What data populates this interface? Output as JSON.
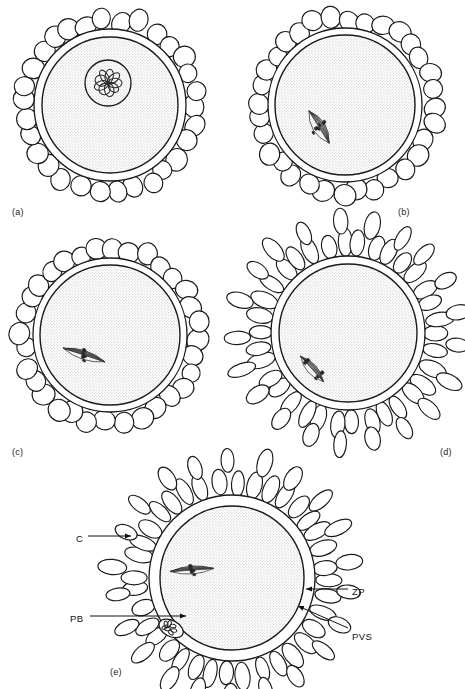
{
  "figure": {
    "type": "biological-schematic-diagram",
    "panel_count": 5,
    "line_color": "#1a1a1a",
    "fill_color": "#ffffff",
    "ooplasm_fill": "stippled-grey"
  },
  "panels": [
    {
      "id": "a",
      "label": "(a)",
      "label_x": 12,
      "label_y": 207,
      "stage": "germinal vesicle stage",
      "cumulus_shape": "round",
      "has_germinal_vesicle": true,
      "has_spindle": false,
      "has_polar_body": false,
      "center_x": 110,
      "center_y": 105,
      "ooplasm_r": 68,
      "pvs_r": 76,
      "cumulus_layers": 1,
      "cumulus_count": 30
    },
    {
      "id": "b",
      "label": "(b)",
      "label_x": 398,
      "label_y": 207,
      "stage": "germinal vesicle breakdown",
      "cumulus_shape": "round",
      "has_germinal_vesicle": false,
      "has_spindle": true,
      "spindle_type": "prometaphase I",
      "has_polar_body": false,
      "center_x": 345,
      "center_y": 105,
      "ooplasm_r": 70,
      "pvs_r": 77,
      "cumulus_layers": 1,
      "cumulus_count": 32
    },
    {
      "id": "c",
      "label": "(c)",
      "label_x": 12,
      "label_y": 447,
      "stage": "metaphase I",
      "cumulus_shape": "round",
      "has_germinal_vesicle": false,
      "has_spindle": true,
      "spindle_type": "metaphase I",
      "has_polar_body": false,
      "center_x": 110,
      "center_y": 335,
      "ooplasm_r": 70,
      "pvs_r": 77,
      "cumulus_layers": 1,
      "cumulus_count": 32
    },
    {
      "id": "d",
      "label": "(d)",
      "label_x": 440,
      "label_y": 447,
      "stage": "anaphase / telophase I, cumulus expansion begins",
      "cumulus_shape": "elongated",
      "has_germinal_vesicle": false,
      "has_spindle": true,
      "spindle_type": "telophase I",
      "has_polar_body": false,
      "center_x": 348,
      "center_y": 333,
      "ooplasm_r": 69,
      "pvs_r": 77,
      "cumulus_layers": 2,
      "cumulus_count": 34
    },
    {
      "id": "e",
      "label": "(e)",
      "label_x": 110,
      "label_y": 667,
      "stage": "metaphase II with first polar body, expanded cumulus",
      "cumulus_shape": "elongated",
      "has_germinal_vesicle": false,
      "has_spindle": true,
      "spindle_type": "metaphase II",
      "has_polar_body": true,
      "center_x": 232,
      "center_y": 578,
      "ooplasm_r": 72,
      "pvs_r": 83,
      "cumulus_layers": 2,
      "cumulus_count": 36
    }
  ],
  "annotations": [
    {
      "id": "c",
      "text": "C",
      "meaning": "cumulus cell",
      "text_x": 76,
      "text_y": 533,
      "line_x1": 88,
      "line_y1": 536,
      "line_x2": 131,
      "line_y2": 536,
      "arrow": true,
      "arrow_dir": "right"
    },
    {
      "id": "zp",
      "text": "ZP",
      "meaning": "zona pellucida",
      "text_x": 352,
      "text_y": 586,
      "line_x1": 348,
      "line_y1": 589,
      "line_x2": 306,
      "line_y2": 589,
      "arrow": true,
      "arrow_dir": "left"
    },
    {
      "id": "pb",
      "text": "PB",
      "meaning": "polar body",
      "text_x": 70,
      "text_y": 613,
      "line_x1": 90,
      "line_y1": 616,
      "line_x2": 186,
      "line_y2": 616,
      "arrow": true,
      "arrow_dir": "right"
    },
    {
      "id": "pvs",
      "text": "PVS",
      "meaning": "perivitelline space",
      "text_x": 352,
      "text_y": 631,
      "line_x1": 348,
      "line_y1": 628,
      "line_x2": 298,
      "line_y2": 606,
      "arrow": true,
      "arrow_dir": "upleft"
    }
  ]
}
